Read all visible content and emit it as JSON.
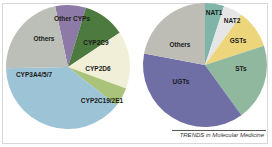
{
  "chart_data": [
    {
      "type": "pie",
      "title": "",
      "start_angle_deg": -12,
      "center": [
        68,
        67
      ],
      "radius": 62,
      "slices": [
        {
          "label": "Other CYPs",
          "value": 8,
          "color": "#8e7aa6"
        },
        {
          "label": "CYP2C9",
          "value": 11,
          "color": "#4d7a3e"
        },
        {
          "label": "CYP2D6",
          "value": 15,
          "color": "#f2efd8"
        },
        {
          "label": "CYP2C19/2E1",
          "value": 5,
          "color": "#a9c47a"
        },
        {
          "label": "CYP3A4/5/7",
          "value": 39,
          "color": "#9cc3d6"
        },
        {
          "label": "Others",
          "value": 22,
          "color": "#bcbfb8"
        }
      ]
    },
    {
      "type": "pie",
      "title": "",
      "start_angle_deg": 0,
      "center": [
        205,
        65
      ],
      "radius": 62,
      "slices": [
        {
          "label": "NAT1",
          "value": 5,
          "color": "#7fb5a8"
        },
        {
          "label": "NAT2",
          "value": 5,
          "color": "#e6e6e6"
        },
        {
          "label": "GSTs",
          "value": 10,
          "color": "#ecd57a"
        },
        {
          "label": "STs",
          "value": 20,
          "color": "#8fb89e"
        },
        {
          "label": "UGTs",
          "value": 38,
          "color": "#6f6fa6"
        },
        {
          "label": "Others",
          "value": 22,
          "color": "#bdbdb5"
        }
      ]
    }
  ],
  "caption": "TRENDS in Molecular Medicine"
}
